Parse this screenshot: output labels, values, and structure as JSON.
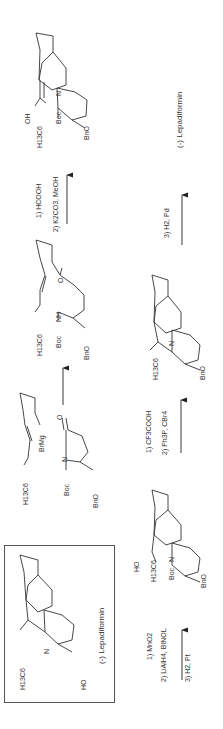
{
  "scheme": {
    "orientation": "rotated -90deg",
    "target": {
      "name": "(-) Lepadiformin",
      "substituents": {
        "alkyl": "H13C6",
        "alcohol": "HO",
        "amine": "N"
      }
    },
    "steps": [
      {
        "id": "step1",
        "reagents": [],
        "from": {
          "labels": [
            "H13C6",
            "BrMg"
          ]
        },
        "with": {
          "labels": [
            "Boc",
            "N",
            "O",
            "BnO"
          ]
        },
        "product": {
          "labels": [
            "H13C6",
            "Boc",
            "NH",
            "O",
            "BnO"
          ]
        }
      },
      {
        "id": "step2",
        "reagents": [
          "1) HCOOH",
          "2) K2CO3, MeOH"
        ],
        "product": {
          "labels": [
            "OH",
            "H13C6",
            "Boc",
            "N",
            "BnO"
          ]
        }
      },
      {
        "id": "step3",
        "reagents": [
          "3) H2, Pd"
        ],
        "product_name": "(-) Lepadiformin"
      },
      {
        "id": "step4",
        "reagents": [
          "1) MnO2",
          "2) LiAlH4, BINOL",
          "3) H2, Pt"
        ],
        "product": {
          "labels": [
            "HO",
            "H13C6",
            "Boc",
            "N",
            "BnO"
          ]
        }
      },
      {
        "id": "step5",
        "reagents": [
          "1) CF3COOH",
          "2) Ph3P, CBr4"
        ],
        "product": {
          "labels": [
            "H13C6",
            "N",
            "BnO"
          ]
        }
      }
    ],
    "text": {
      "lepadiformin_top": "(-) Lepadiformin",
      "lepadiformin_box": "(-) Lepadiformin",
      "r_hcooh": "1) HCOOH",
      "r_k2co3": "2) K2CO3, MeOH",
      "r_h2pd": "3) H2, Pd",
      "r_cf3": "1) CF3COOH",
      "r_ph3p": "2) Ph3P, CBr4",
      "r_mno2": "1) MnO2",
      "r_lialh4": "2) LiAlH4, BINOL",
      "r_h2pt": "3) H2, Pt",
      "h13c6": "H13C6",
      "boc": "Boc",
      "bno": "BnO",
      "n": "N",
      "nh": "NH",
      "o": "O",
      "oh": "OH",
      "ho": "HO",
      "brmg": "BrMg"
    }
  }
}
